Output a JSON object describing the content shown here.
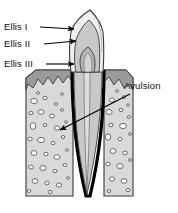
{
  "figure": {
    "labels": [
      {
        "id": "ellis-1",
        "text": "Ellis I",
        "x": 4,
        "y": 30
      },
      {
        "id": "ellis-2",
        "text": "Ellis II",
        "x": 4,
        "y": 47
      },
      {
        "id": "ellis-3",
        "text": "Ellis III",
        "x": 4,
        "y": 67
      },
      {
        "id": "avulsion",
        "text": "Avulsion",
        "x": 124,
        "y": 89
      }
    ],
    "leaders": [
      {
        "id": "leader-ellis-1",
        "x1": 40,
        "y1": 27,
        "x2": 76,
        "y2": 29
      },
      {
        "id": "leader-ellis-2",
        "x1": 44,
        "y1": 44,
        "x2": 78,
        "y2": 41
      },
      {
        "id": "leader-ellis-3",
        "x1": 46,
        "y1": 64,
        "x2": 76,
        "y2": 64
      },
      {
        "id": "leader-avulsion",
        "x1": 130,
        "y1": 94,
        "x2": 58,
        "y2": 131
      }
    ],
    "colors": {
      "background": "#ffffff",
      "text": "#111111",
      "leader_line": "#000000",
      "bone_fill": "#d9d9d9",
      "bone_speckle": "#a9a9a9",
      "gingiva_fill": "#9a9a9a",
      "enamel_fill": "#efefef",
      "dentin_fill": "#c8c8c8",
      "pulp_fill": "#b4b4b4",
      "outline": "#3a3a3a",
      "ligament_dark": "#000000"
    },
    "structures": [
      {
        "id": "enamel",
        "name": "tooth-enamel-layer"
      },
      {
        "id": "dentin",
        "name": "tooth-dentin-layer"
      },
      {
        "id": "pulp",
        "name": "tooth-pulp-chamber"
      },
      {
        "id": "root",
        "name": "tooth-root"
      },
      {
        "id": "alveolar-bone",
        "name": "alveolar-bone-block"
      },
      {
        "id": "gingiva",
        "name": "gingiva-band"
      },
      {
        "id": "periodontal",
        "name": "periodontal-ligament-space"
      }
    ]
  }
}
